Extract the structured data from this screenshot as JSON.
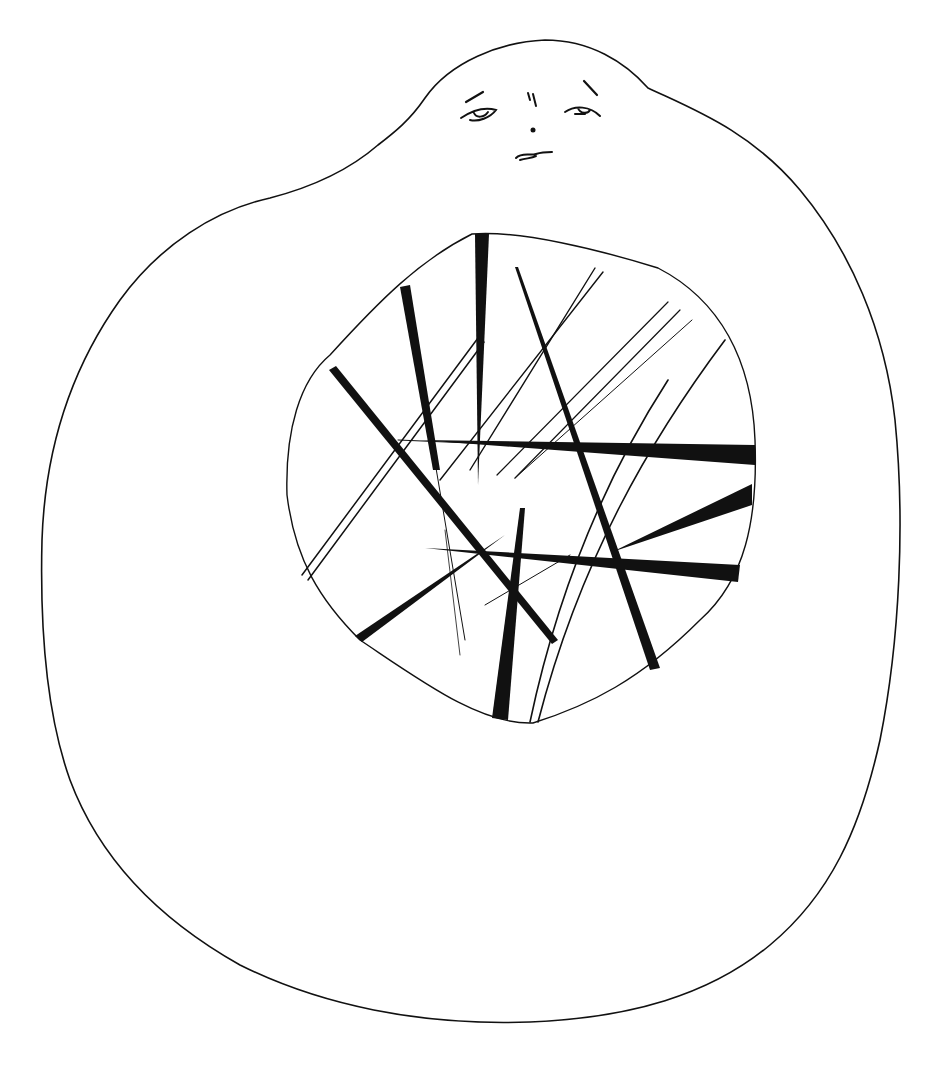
{
  "artwork": {
    "subject": "ink drawing of a blob-shaped figure with a small face and a circular window filled with crossing lines",
    "colors": {
      "ink": "#111111",
      "paper": "#ffffff"
    },
    "parts": {
      "body": "blob-outline",
      "face": [
        "left-eyebrow",
        "right-eyebrow",
        "left-eye",
        "right-eye",
        "nose-marks",
        "nose-dot",
        "mouth"
      ],
      "window": "irregular-circle-with-crossing-strokes"
    }
  }
}
